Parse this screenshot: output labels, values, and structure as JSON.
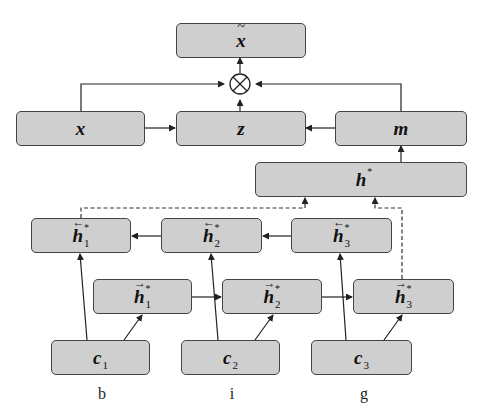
{
  "diagram": {
    "colors": {
      "box_fill": "#cfcfcf",
      "box_border": "#444444",
      "line": "#222222"
    },
    "nodes": {
      "x_tilde": {
        "symbol": "x",
        "accent": "~"
      },
      "x": {
        "symbol": "x"
      },
      "z": {
        "symbol": "z"
      },
      "m": {
        "symbol": "m"
      },
      "h_star": {
        "symbol": "h",
        "sup": "*"
      },
      "h_back": [
        {
          "symbol": "h",
          "sup": "*",
          "sub": "1",
          "arrow": "←"
        },
        {
          "symbol": "h",
          "sup": "*",
          "sub": "2",
          "arrow": "←"
        },
        {
          "symbol": "h",
          "sup": "*",
          "sub": "3",
          "arrow": "←"
        }
      ],
      "h_fwd": [
        {
          "symbol": "h",
          "sup": "*",
          "sub": "1",
          "arrow": "→"
        },
        {
          "symbol": "h",
          "sup": "*",
          "sub": "2",
          "arrow": "→"
        },
        {
          "symbol": "h",
          "sup": "*",
          "sub": "3",
          "arrow": "→"
        }
      ],
      "c": [
        {
          "symbol": "c",
          "sub": "1"
        },
        {
          "symbol": "c",
          "sub": "2"
        },
        {
          "symbol": "c",
          "sub": "3"
        }
      ]
    },
    "operator": {
      "symbol": "⊗",
      "name": "element-wise product"
    },
    "input_labels": [
      "b",
      "i",
      "g"
    ]
  }
}
